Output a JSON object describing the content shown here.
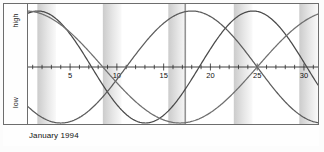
{
  "chart_data": {
    "type": "line",
    "title": "",
    "xlabel": "January 1994",
    "ylabel": "",
    "axis_labels": {
      "top": "high",
      "bottom": "low"
    },
    "x": [
      1,
      2,
      3,
      4,
      5,
      6,
      7,
      8,
      9,
      10,
      11,
      12,
      13,
      14,
      15,
      16,
      17,
      18,
      19,
      20,
      21,
      22,
      23,
      24,
      25,
      26,
      27,
      28,
      29,
      30,
      31
    ],
    "xlim": [
      0.5,
      31.5
    ],
    "ylim": [
      -1,
      1
    ],
    "xticks": [
      1,
      2,
      3,
      4,
      5,
      6,
      7,
      8,
      9,
      10,
      11,
      12,
      13,
      14,
      15,
      16,
      17,
      18,
      19,
      20,
      21,
      22,
      23,
      24,
      25,
      26,
      27,
      28,
      29,
      30,
      31
    ],
    "xtick_labels": [
      {
        "value": 5,
        "label": "5"
      },
      {
        "value": 10,
        "label": "10"
      },
      {
        "value": 15,
        "label": "15"
      },
      {
        "value": 20,
        "label": "20"
      },
      {
        "value": 25,
        "label": "25"
      },
      {
        "value": 30,
        "label": "30"
      }
    ],
    "grid": false,
    "legend": "none",
    "zero_line": true,
    "marker_line": {
      "label": "today",
      "value": 17.3
    },
    "shaded_bands": [
      {
        "start": 1.5,
        "end": 3.5,
        "label": "weekend"
      },
      {
        "start": 8.5,
        "end": 10.5,
        "label": "weekend"
      },
      {
        "start": 15.5,
        "end": 17.5,
        "label": "weekend"
      },
      {
        "start": 22.5,
        "end": 24.5,
        "label": "weekend"
      },
      {
        "start": 29.5,
        "end": 31.5,
        "label": "weekend"
      }
    ],
    "band_color": "#c9c9c9",
    "series": [
      {
        "name": "physical",
        "period": 23,
        "phase": 5.2,
        "color": "#4a4a4a",
        "values": [
          0.55,
          0.76,
          0.91,
          0.99,
          1.0,
          0.94,
          0.8,
          0.61,
          0.38,
          0.12,
          -0.14,
          -0.39,
          -0.62,
          -0.81,
          -0.94,
          -1.0,
          -0.98,
          -0.89,
          -0.73,
          -0.52,
          -0.28,
          -0.02,
          0.24,
          0.48,
          0.69,
          0.85,
          0.96,
          1.0,
          0.97,
          0.87,
          0.71
        ]
      },
      {
        "name": "emotional",
        "period": 28,
        "phase": 18.0,
        "color": "#5c5c5c",
        "values": [
          -0.9,
          -0.97,
          -1.0,
          -0.97,
          -0.9,
          -0.78,
          -0.62,
          -0.43,
          -0.22,
          0.0,
          0.22,
          0.43,
          0.62,
          0.78,
          0.9,
          0.97,
          1.0,
          0.97,
          0.9,
          0.78,
          0.62,
          0.43,
          0.22,
          0.0,
          -0.22,
          -0.43,
          -0.62,
          -0.78,
          -0.9,
          -0.97,
          -1.0
        ]
      },
      {
        "name": "intellectual",
        "period": 33,
        "phase": 9.0,
        "color": "#6f6f6f",
        "values": [
          0.17,
          0.35,
          0.51,
          0.66,
          0.79,
          0.89,
          0.96,
          1.0,
          1.0,
          0.96,
          0.89,
          0.79,
          0.66,
          0.51,
          0.35,
          0.17,
          -0.02,
          -0.21,
          -0.39,
          -0.55,
          -0.7,
          -0.82,
          -0.92,
          -0.98,
          -1.0,
          -0.99,
          -0.94,
          -0.86,
          -0.74,
          -0.6,
          -0.44
        ]
      }
    ]
  },
  "caption": {
    "text": "January 1994"
  }
}
